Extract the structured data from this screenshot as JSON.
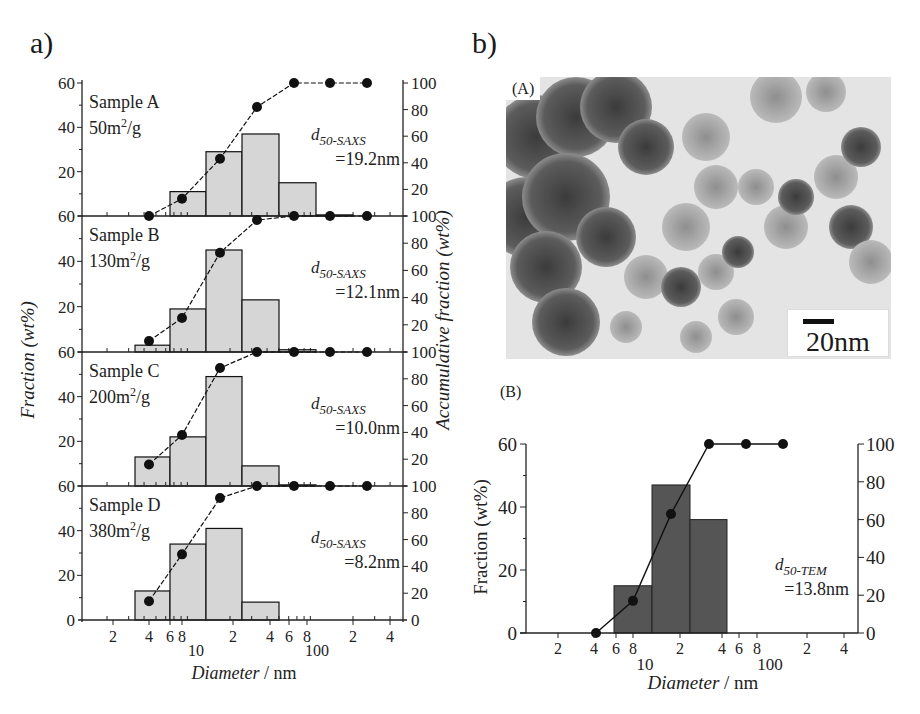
{
  "panels": {
    "a_label": "a)",
    "b_label": "b)",
    "tem_tag": "(A)",
    "scale_bar_label": "20nm",
    "hist_tag": "(B)"
  },
  "left_axis_label": "Fraction (wt%)",
  "right_axis_label": "Accumulative fraction (wt%)",
  "x_axis_label_italic": "Diameter",
  "x_axis_label_unit": " / nm",
  "x_tick_labels": [
    "2",
    "4",
    "6",
    "8",
    "10",
    "2",
    "4",
    "6",
    "8",
    "100",
    "2",
    "4"
  ],
  "colors": {
    "bar_light": "#d6d6d6",
    "bar_dark": "#555555",
    "line": "#111111",
    "axis": "#222222"
  },
  "chart_data": [
    {
      "type": "bar",
      "title": "Sample A",
      "subtitle": "50m2/g",
      "annotation": "d50-SAXS =19.2nm",
      "annotation_sub": "50-SAXS",
      "annotation_value": "=19.2nm",
      "surface_area_num": "50m",
      "xlabel": "Diameter / nm",
      "ylabel": "Fraction (wt%)",
      "y2label": "Accumulative fraction (wt%)",
      "xscale": "log",
      "xlim": [
        1,
        500
      ],
      "ylim": [
        0,
        60
      ],
      "y2lim": [
        0,
        100
      ],
      "bins": [
        [
          5,
          7.5
        ],
        [
          7.5,
          11
        ],
        [
          11,
          16.5
        ],
        [
          16.5,
          25
        ],
        [
          25,
          37
        ],
        [
          37,
          55
        ]
      ],
      "values": [
        0,
        11,
        29,
        37,
        15,
        0.5
      ],
      "cumulative": {
        "x": [
          4,
          7.5,
          14,
          25,
          50,
          100,
          200
        ],
        "y": [
          0,
          13,
          43,
          82,
          100,
          100,
          100
        ]
      }
    },
    {
      "type": "bar",
      "title": "Sample B",
      "subtitle": "130m2/g",
      "annotation": "d50-SAXS =12.1nm",
      "annotation_sub": "50-SAXS",
      "annotation_value": "=12.1nm",
      "surface_area_num": "130m",
      "xscale": "log",
      "ylim": [
        0,
        60
      ],
      "y2lim": [
        0,
        100
      ],
      "values": [
        3,
        19,
        45,
        23,
        1,
        0
      ],
      "cumulative": {
        "x": [
          4,
          7.5,
          14,
          25,
          50,
          100,
          200
        ],
        "y": [
          8,
          25,
          73,
          97,
          100,
          100,
          100
        ]
      }
    },
    {
      "type": "bar",
      "title": "Sample C",
      "subtitle": "200m2/g",
      "annotation": "d50-SAXS =10.0nm",
      "annotation_sub": "50-SAXS",
      "annotation_value": "=10.0nm",
      "surface_area_num": "200m",
      "xscale": "log",
      "ylim": [
        0,
        60
      ],
      "y2lim": [
        0,
        100
      ],
      "values": [
        13,
        22,
        49,
        9,
        0.5,
        0
      ],
      "cumulative": {
        "x": [
          4,
          7.5,
          14,
          25,
          50,
          100,
          200
        ],
        "y": [
          16,
          38,
          88,
          100,
          100,
          100,
          100
        ]
      }
    },
    {
      "type": "bar",
      "title": "Sample D",
      "subtitle": "380m2/g",
      "annotation": "d50-SAXS =8.2nm",
      "annotation_sub": "50-SAXS",
      "annotation_value": "=8.2nm",
      "surface_area_num": "380m",
      "xscale": "log",
      "ylim": [
        0,
        60
      ],
      "y2lim": [
        0,
        100
      ],
      "values": [
        13,
        34,
        41,
        8,
        0,
        0
      ],
      "cumulative": {
        "x": [
          4,
          7.5,
          14,
          25,
          50,
          100,
          200
        ],
        "y": [
          14,
          49,
          91,
          100,
          100,
          100,
          100
        ]
      }
    },
    {
      "type": "bar",
      "title": "(B) TEM size distribution",
      "annotation": "d50-TEM =13.8nm",
      "annotation_sub": "50-TEM",
      "annotation_value": "=13.8nm",
      "xlabel": "Diameter / nm",
      "ylabel": "Fraction (wt%)",
      "xscale": "log",
      "ylim": [
        0,
        60
      ],
      "y2lim": [
        0,
        100
      ],
      "y_ticks": [
        "0",
        "20",
        "40",
        "60"
      ],
      "y2_ticks": [
        "0",
        "20",
        "40",
        "60",
        "80",
        "100"
      ],
      "bins": [
        [
          5.5,
          10.5
        ],
        [
          10.5,
          21
        ],
        [
          21,
          40
        ]
      ],
      "values": [
        15,
        47,
        36
      ],
      "cumulative": {
        "x": [
          4,
          7.5,
          15,
          30,
          60,
          120
        ],
        "y": [
          0,
          17,
          63,
          100,
          100,
          100
        ]
      }
    }
  ],
  "left_ticks": {
    "top": "60",
    "t40": "40",
    "t20": "20",
    "bottom": "0"
  },
  "right_ticks": [
    "100",
    "80",
    "60",
    "40",
    "20",
    "0"
  ]
}
